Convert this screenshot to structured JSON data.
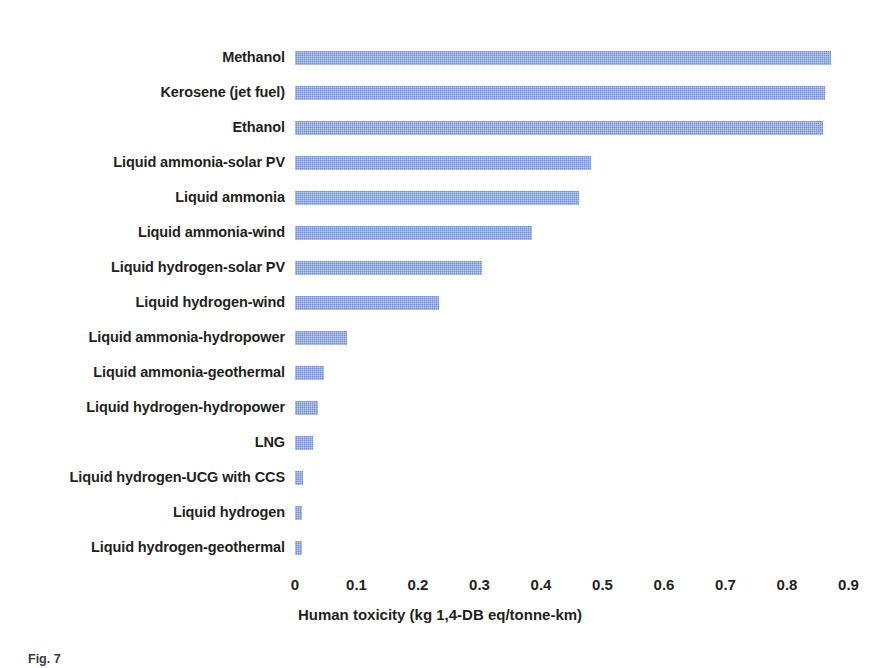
{
  "figure": {
    "caption_label": "Fig. 7",
    "caption_text": ""
  },
  "chart_data": {
    "type": "bar",
    "orientation": "horizontal",
    "title": "",
    "xlabel": "Human toxicity (kg 1,4-DB eq/tonne-km)",
    "ylabel": "",
    "xlim": [
      0,
      0.9
    ],
    "xticks": [
      "0",
      "0.1",
      "0.2",
      "0.3",
      "0.4",
      "0.5",
      "0.6",
      "0.7",
      "0.8",
      "0.9"
    ],
    "xtick_values": [
      0,
      0.1,
      0.2,
      0.3,
      0.4,
      0.5,
      0.6,
      0.7,
      0.8,
      0.9
    ],
    "grid": false,
    "legend": "none",
    "bar_color": "#6f8ee0",
    "categories": [
      "Methanol",
      "Kerosene (jet fuel)",
      "Ethanol",
      "Liquid ammonia-solar PV",
      "Liquid ammonia",
      "Liquid ammonia-wind",
      "Liquid hydrogen-solar PV",
      "Liquid hydrogen-wind",
      "Liquid ammonia-hydropower",
      "Liquid ammonia-geothermal",
      "Liquid hydrogen-hydropower",
      "LNG",
      "Liquid hydrogen-UCG with CCS",
      "Liquid hydrogen",
      "Liquid hydrogen-geothermal"
    ],
    "values": [
      0.871,
      0.862,
      0.858,
      0.481,
      0.462,
      0.385,
      0.304,
      0.234,
      0.085,
      0.047,
      0.037,
      0.03,
      0.013,
      0.011,
      0.011
    ]
  }
}
